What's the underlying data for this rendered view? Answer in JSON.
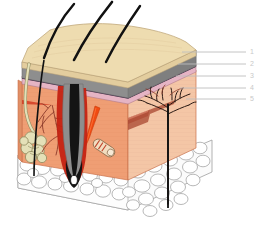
{
  "figure": {
    "type": "anatomical-illustration",
    "background_color": "#ffffff",
    "width": 261,
    "height": 246
  },
  "labels": {
    "callouts": [
      {
        "number": "1",
        "x": 250,
        "y": 48,
        "line_y": 52,
        "line_x1": 182,
        "line_x2": 246
      },
      {
        "number": "2",
        "x": 250,
        "y": 60,
        "line_y": 64,
        "line_x1": 178,
        "line_x2": 246
      },
      {
        "number": "3",
        "x": 250,
        "y": 72,
        "line_y": 76,
        "line_x1": 176,
        "line_x2": 246
      },
      {
        "number": "4",
        "x": 250,
        "y": 84,
        "line_y": 88,
        "line_x1": 180,
        "line_x2": 246
      },
      {
        "number": "5",
        "x": 250,
        "y": 95,
        "line_y": 99,
        "line_x1": 186,
        "line_x2": 246
      }
    ],
    "leader_line_color": "#bdbdbd",
    "number_color": "#c9c9c9"
  },
  "structures": {
    "hair_shafts": {
      "name": "hair-shafts",
      "count": 3,
      "color": "#1a1a1a"
    },
    "epidermis_surface": {
      "name": "epidermis-top-surface",
      "color": "#eedcb0",
      "shade_color": "#e3cd9e"
    },
    "stratum_corneum_band": {
      "name": "gray-keratin-band",
      "color": "#8e8e8e",
      "side_color": "#7a7a7a"
    },
    "basal_layer_band": {
      "name": "pink-basal-band",
      "color": "#e5b4c4",
      "side_color": "#d6a2b4"
    },
    "junction_line": {
      "name": "dermo-epidermal-junction",
      "color": "#3a1f3f"
    },
    "dermis": {
      "name": "dermis-body",
      "color": "#f0ab82",
      "right_face_color": "#f3c4a5",
      "front_face_color": "#ef9e74"
    },
    "papillary_capillaries": {
      "name": "capillary-loops",
      "color": "#c42212"
    },
    "dermal_ridges_right": {
      "name": "dermal-ridge-bands",
      "color": "#b35442"
    },
    "subcutaneous_fat": {
      "name": "subcutaneous-fat-layer",
      "cell_fill": "#fdfdfd",
      "cell_stroke": "#9a9a9a"
    },
    "sweat_gland": {
      "name": "sweat-gland",
      "fill": "#e4e0b8",
      "stroke": "#8f8a5e"
    },
    "arrector_pili_muscle": {
      "name": "arrector-pili-muscle",
      "color": "#f04a12"
    },
    "hair_follicle": {
      "name": "hair-follicle",
      "sheath_color": "#8e8e8e",
      "shaft_color": "#111111"
    },
    "nerve_tree": {
      "name": "nerve-branch-tree",
      "color": "#2b1a14"
    },
    "corpuscle": {
      "name": "lamellar-corpuscle",
      "fill": "#f2ddc0",
      "band_color": "#c0432a"
    },
    "vascular_network": {
      "name": "dermal-vascular-network",
      "color": "#8b3a2a"
    }
  }
}
